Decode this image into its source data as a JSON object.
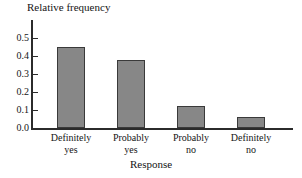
{
  "chart_data": {
    "type": "bar",
    "title": "",
    "xlabel": "Response",
    "ylabel": "Relative frequency",
    "categories": [
      "Definitely yes",
      "Probably yes",
      "Probably no",
      "Definitely no"
    ],
    "category_lines": [
      [
        "Definitely",
        "yes"
      ],
      [
        "Probably",
        "yes"
      ],
      [
        "Probably",
        "no"
      ],
      [
        "Definitely",
        "no"
      ]
    ],
    "values": [
      0.45,
      0.38,
      0.125,
      0.06
    ],
    "ylim": [
      0.0,
      0.6
    ],
    "yticks": [
      0.0,
      0.1,
      0.2,
      0.3,
      0.4,
      0.5
    ],
    "ytick_labels": [
      "0.0",
      "0.1",
      "0.2",
      "0.3",
      "0.4",
      "0.5"
    ],
    "grid": false,
    "legend": false,
    "bar_fill_color": "#878787",
    "bar_edge_color": "#3a3a3a",
    "axis_color": "#2b2b2b"
  }
}
